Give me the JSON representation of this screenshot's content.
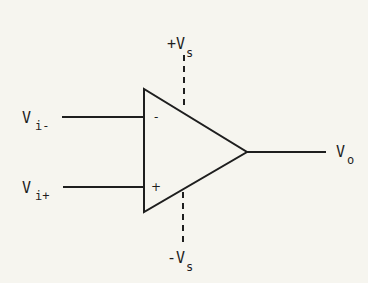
{
  "diagram": {
    "type": "op-amp symbol",
    "inputs": {
      "inverting": {
        "label": "V",
        "subscript": "i-",
        "sign": "-"
      },
      "non_inverting": {
        "label": "V",
        "subscript": "i+",
        "sign": "+"
      }
    },
    "output": {
      "label": "V",
      "subscript": "o"
    },
    "supply": {
      "positive": {
        "label": "+V",
        "subscript": "s"
      },
      "negative": {
        "label": "-V",
        "subscript": "s"
      }
    },
    "colors": {
      "line": "#1e1e1e",
      "background": "#f6f5ef"
    }
  }
}
